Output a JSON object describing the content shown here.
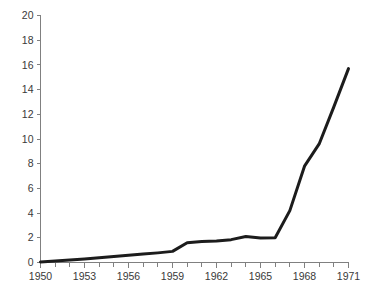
{
  "chart_data": {
    "type": "line",
    "title": "",
    "subtitle": "",
    "xlabel": "",
    "ylabel": "",
    "xlim": [
      1950,
      1971
    ],
    "ylim": [
      0,
      20
    ],
    "grid": false,
    "legend": null,
    "x_tick_labels": [
      "1950",
      "1953",
      "1956",
      "1959",
      "1962",
      "1965",
      "1968",
      "1971"
    ],
    "x_tick_values": [
      1950,
      1953,
      1956,
      1959,
      1962,
      1965,
      1968,
      1971
    ],
    "x_minor_ticks": [
      1951,
      1952,
      1954,
      1955,
      1957,
      1958,
      1960,
      1961,
      1963,
      1964,
      1966,
      1967,
      1969,
      1970
    ],
    "y_tick_labels": [
      "0",
      "2",
      "4",
      "6",
      "8",
      "10",
      "12",
      "14",
      "16",
      "18",
      "20"
    ],
    "y_tick_values": [
      0,
      2,
      4,
      6,
      8,
      10,
      12,
      14,
      16,
      18,
      20
    ],
    "series": [
      {
        "name": "series-1",
        "color": "#1c1c1c",
        "x": [
          1950,
          1951,
          1952,
          1953,
          1954,
          1955,
          1956,
          1957,
          1958,
          1959,
          1960,
          1961,
          1962,
          1963,
          1964,
          1965,
          1966,
          1967,
          1968,
          1969,
          1970,
          1971
        ],
        "values": [
          0.05,
          0.12,
          0.2,
          0.28,
          0.38,
          0.48,
          0.58,
          0.68,
          0.78,
          0.9,
          1.6,
          1.7,
          1.75,
          1.85,
          2.1,
          1.98,
          2.0,
          4.2,
          7.8,
          9.6,
          12.6,
          15.7
        ]
      }
    ]
  },
  "axes": {
    "y_axis_name": "y-axis",
    "x_axis_name": "x-axis"
  }
}
